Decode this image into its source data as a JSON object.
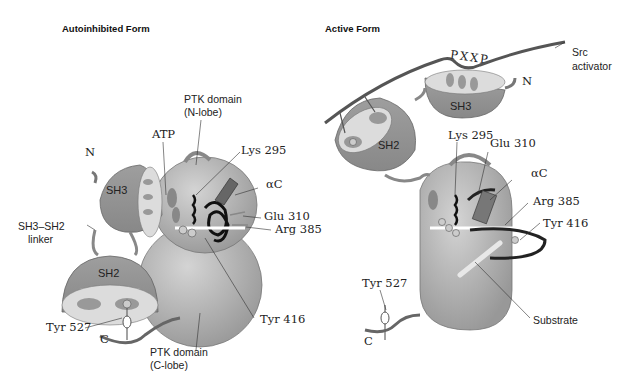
{
  "panels": [
    {
      "title": "Autoinhibited Form",
      "labels": {
        "ptk_n": "PTK domain",
        "ptk_n2": "(N-lobe)",
        "atp": "ATP",
        "lys": "Lys 295",
        "n_term": "N",
        "ac": "αC",
        "sh3": "SH3",
        "glu": "Glu 310",
        "arg": "Arg 385",
        "linker1": "SH3–SH2",
        "linker2": "linker",
        "sh2": "SH2",
        "tyr527": "Tyr 527",
        "tyr416": "Tyr 416",
        "c_term": "C",
        "ptk_c": "PTK domain",
        "ptk_c2": "(C-lobe)",
        "p": "P"
      }
    },
    {
      "title": "Active Form",
      "labels": {
        "pxxp": "PXXP",
        "src1": "Src",
        "src2": "activator",
        "n_term": "N",
        "sh3": "SH3",
        "sh2": "SH2",
        "lys": "Lys 295",
        "glu": "Glu 310",
        "ac": "αC",
        "arg": "Arg 385",
        "tyr416": "Tyr 416",
        "tyr527": "Tyr 527",
        "substrate": "Substrate",
        "c_term": "C",
        "p": "P"
      }
    }
  ],
  "colors": {
    "domain_fill": "#b4b4b4",
    "domain_dark": "#8a8a8a",
    "cavity_fill": "#dcdcdc",
    "chain": "#555555",
    "helix": "#1a1a1a"
  }
}
